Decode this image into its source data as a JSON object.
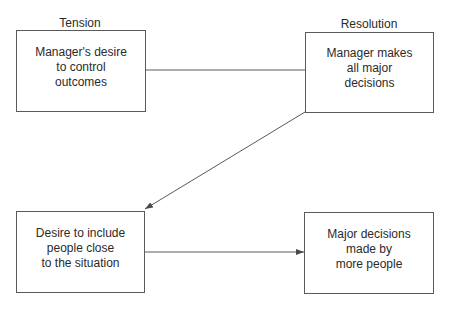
{
  "diagram": {
    "column_labels": {
      "left": "Tension",
      "right": "Resolution"
    },
    "nodes": [
      {
        "id": "manager-desire",
        "text": "Manager's desire\nto control\noutcomes"
      },
      {
        "id": "manager-decides",
        "text": "Manager makes\nall major\ndecisions"
      },
      {
        "id": "desire-include",
        "text": "Desire to include\npeople close\nto the situation"
      },
      {
        "id": "decisions-more-people",
        "text": "Major decisions\nmade by\nmore people"
      }
    ],
    "edges": [
      {
        "from": "manager-desire",
        "to": "manager-decides",
        "arrow": false
      },
      {
        "from": "manager-decides",
        "to": "desire-include",
        "arrow": true
      },
      {
        "from": "desire-include",
        "to": "decisions-more-people",
        "arrow": true
      }
    ],
    "colors": {
      "line": "#5a5a5a",
      "text": "#2a2a2a",
      "background": "#ffffff"
    }
  }
}
